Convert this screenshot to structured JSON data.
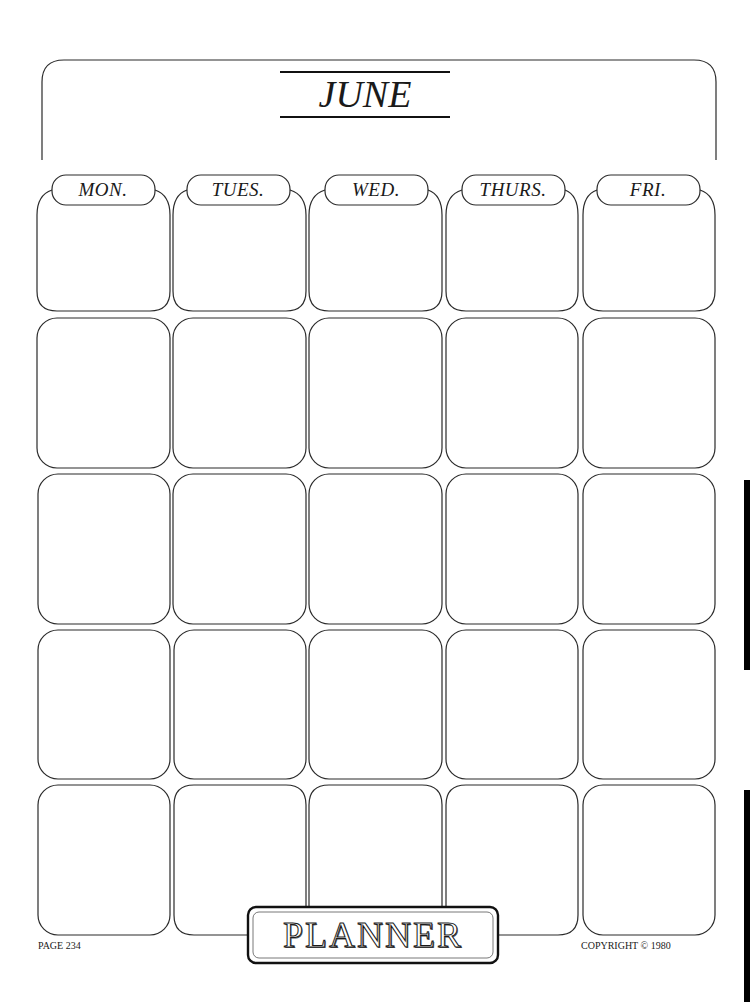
{
  "page": {
    "month": "JUNE",
    "days": [
      "MON.",
      "TUES.",
      "WED.",
      "THURS.",
      "FRI."
    ],
    "rows": 5,
    "planner_label": "PLANNER",
    "page_number": "PAGE 234",
    "copyright": "COPYRIGHT © 1980"
  }
}
